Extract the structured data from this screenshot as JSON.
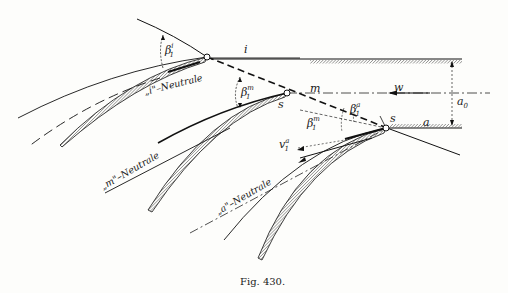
{
  "figure": {
    "caption": "Fig. 430.",
    "type": "blade-cascade flow diagram",
    "colors": {
      "ink": "#1a1a1a",
      "paper": "#fdfdfb"
    }
  },
  "labels": {
    "i": "i",
    "m": "m",
    "a": "a",
    "w": "w",
    "a0": "a",
    "a0_sub": "0",
    "s_m": "s",
    "s_a": "s",
    "beta": "β",
    "beta_sub": "1",
    "beta_i_sup": "i",
    "beta_m_sup": "m",
    "beta_a_sup": "a",
    "v": "v",
    "v_sub": "1",
    "v_sup": "a",
    "neutral_i": "„i\"–Neutrale",
    "neutral_m": "„m\"–Neutrale",
    "neutral_a": "„a\"–Neutrale"
  }
}
